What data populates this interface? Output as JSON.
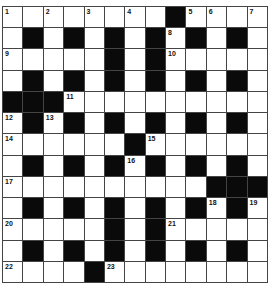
{
  "puzzle": {
    "rows": 13,
    "cols": 13,
    "grid": [
      "1.2.3.4.#56.7",
      ".#.#.#.#8#.#.",
      "9....#.#10....",
      ".#.#.#.#.#.#.",
      "###11.........",
      "12#13#.#.#.#.#.",
      "14.....#15.....",
      ".#.#.#16#.#.#.",
      "17.........###",
      ".#.#.#.#.#18#19",
      "20....#.#21....",
      ".#.#.#.#.#.#.",
      "22...#23......."
    ],
    "cells": [
      [
        "1",
        "",
        "2",
        "",
        "3",
        "",
        "4",
        "",
        "#",
        "5",
        "6",
        "",
        "7"
      ],
      [
        "",
        "#",
        "",
        "#",
        "",
        "#",
        "",
        "#",
        "8",
        "#",
        "",
        "#",
        ""
      ],
      [
        "9",
        "",
        "",
        "",
        "",
        "#",
        "",
        "#",
        "10",
        "",
        "",
        "",
        ""
      ],
      [
        "",
        "#",
        "",
        "#",
        "",
        "#",
        "",
        "#",
        "",
        "#",
        "",
        "#",
        ""
      ],
      [
        "#",
        "#",
        "#",
        "11",
        "",
        "",
        "",
        "",
        "",
        "",
        "",
        "",
        ""
      ],
      [
        "12",
        "#",
        "13",
        "#",
        "",
        "#",
        "",
        "#",
        "",
        "#",
        "",
        "#",
        ""
      ],
      [
        "14",
        "",
        "",
        "",
        "",
        "",
        "#",
        "15",
        "",
        "",
        "",
        "",
        ""
      ],
      [
        "",
        "#",
        "",
        "#",
        "",
        "#",
        "16",
        "#",
        "",
        "#",
        "",
        "#",
        ""
      ],
      [
        "17",
        "",
        "",
        "",
        "",
        "",
        "",
        "",
        "",
        "",
        "#",
        "#",
        "#"
      ],
      [
        "",
        "#",
        "",
        "#",
        "",
        "#",
        "",
        "#",
        "",
        "#",
        "18",
        "#",
        "19"
      ],
      [
        "20",
        "",
        "",
        "",
        "",
        "#",
        "",
        "#",
        "21",
        "",
        "",
        "",
        ""
      ],
      [
        "",
        "#",
        "",
        "#",
        "",
        "#",
        "",
        "#",
        "",
        "#",
        "",
        "#",
        ""
      ],
      [
        "22",
        "",
        "",
        "",
        "#",
        "23",
        "",
        "",
        "",
        "",
        "",
        "",
        ""
      ]
    ]
  },
  "colors": {
    "black_cell": "#0a0a0a",
    "white_cell": "#ffffff",
    "grid_line": "#444444",
    "number_text": "#111111"
  }
}
